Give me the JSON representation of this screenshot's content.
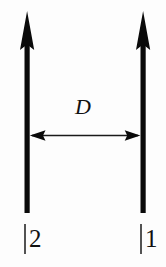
{
  "figure": {
    "type": "physics-diagram",
    "background_color": "#fdfdfd",
    "ink_color": "#0a0a0a"
  },
  "distance_marker": {
    "label": "D",
    "style": "italic",
    "arrow_type": "double-headed",
    "orientation": "horizontal"
  },
  "states": [
    {
      "id": "left",
      "ket_bar": "|",
      "label": "2",
      "full_label": "|2",
      "arrow_direction": "up"
    },
    {
      "id": "right",
      "ket_bar": "|",
      "label": "1",
      "full_label": "|1",
      "arrow_direction": "up"
    }
  ],
  "labels": {
    "left_ket": "|2",
    "right_ket": "|1",
    "separation": "D"
  }
}
